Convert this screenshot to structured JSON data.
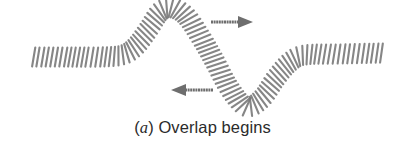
{
  "figure": {
    "colors": {
      "coil": "#7a7a7a",
      "coil_dark": "#5c5c5c",
      "arrow": "#6e6e6e",
      "background": "#ffffff"
    },
    "arrows": [
      {
        "name": "right-moving-pulse-arrow",
        "direction": "right",
        "x1": 211,
        "x2": 252,
        "y": 22
      },
      {
        "name": "left-moving-pulse-arrow",
        "direction": "left",
        "x1": 213,
        "x2": 172,
        "y": 90
      }
    ],
    "pulses": [
      {
        "name": "upward-pulse",
        "direction": "right"
      },
      {
        "name": "downward-pulse",
        "direction": "left"
      }
    ]
  },
  "caption": {
    "open_paren": "(",
    "label": "a",
    "close_paren": ")",
    "text": " Overlap begins"
  }
}
